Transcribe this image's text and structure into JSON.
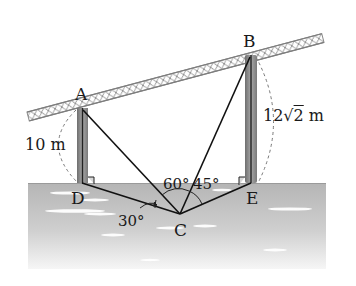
{
  "figure": {
    "type": "geometry-diagram",
    "points": {
      "A": {
        "label": "A"
      },
      "B": {
        "label": "B"
      },
      "C": {
        "label": "C"
      },
      "D": {
        "label": "D"
      },
      "E": {
        "label": "E"
      }
    },
    "lengths": {
      "AD": {
        "value": "10",
        "unit": "m",
        "text": "10 m"
      },
      "BE": {
        "prefix": "12",
        "radicand": "2",
        "unit": "m",
        "text": "12√2 m"
      }
    },
    "angles": {
      "DCA_from_ground": {
        "text": "30°",
        "value": 30
      },
      "ACB_left": {
        "text": "60°",
        "value": 60
      },
      "BCE": {
        "text": "45°",
        "value": 45
      }
    },
    "right_angles": [
      "ADC",
      "BEC"
    ],
    "colors": {
      "line": "#111111",
      "tower": "#8a8a8a",
      "water_top": "#b9b9b9",
      "water_bottom": "#f4f4f4",
      "bridge": "#9a9a9a",
      "dashed_arc": "#777777"
    }
  }
}
